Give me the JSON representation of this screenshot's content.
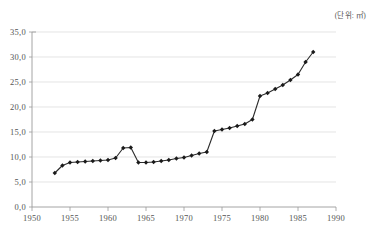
{
  "chart_data": {
    "type": "line",
    "title": "",
    "subtitle": "",
    "unit_label": "(단위: ㎡)",
    "xlabel": "",
    "ylabel": "",
    "xlim": [
      1950,
      1990
    ],
    "ylim": [
      0.0,
      35.0
    ],
    "grid": true,
    "legend": "none",
    "marker": "diamond",
    "line_color": "#2b2b2b",
    "marker_color": "#1a1a1a",
    "grid_color": "#d8d8d8",
    "axis_color": "#9a9a9a",
    "y_ticks": [
      "0,0",
      "5,0",
      "10,0",
      "15,0",
      "20,0",
      "25,0",
      "30,0",
      "35,0"
    ],
    "y_tick_values": [
      0,
      5,
      10,
      15,
      20,
      25,
      30,
      35
    ],
    "x_ticks": [
      "1950",
      "1955",
      "1960",
      "1965",
      "1970",
      "1975",
      "1980",
      "1985",
      "1990"
    ],
    "x_tick_values": [
      1950,
      1955,
      1960,
      1965,
      1970,
      1975,
      1980,
      1985,
      1990
    ],
    "x": [
      1953,
      1954,
      1955,
      1956,
      1957,
      1958,
      1959,
      1960,
      1961,
      1962,
      1963,
      1964,
      1965,
      1966,
      1967,
      1968,
      1969,
      1970,
      1971,
      1972,
      1973,
      1974,
      1975,
      1976,
      1977,
      1978,
      1979,
      1980,
      1981,
      1982,
      1983,
      1984,
      1985,
      1986,
      1987
    ],
    "values": [
      6.8,
      8.3,
      8.9,
      9.0,
      9.1,
      9.2,
      9.3,
      9.4,
      9.8,
      11.8,
      11.9,
      8.9,
      8.9,
      9.0,
      9.2,
      9.4,
      9.7,
      9.9,
      10.3,
      10.7,
      11.0,
      15.2,
      15.5,
      15.8,
      16.2,
      16.6,
      17.5,
      22.2,
      22.8,
      23.6,
      24.4,
      25.4,
      26.5,
      29.0,
      31.0
    ],
    "series": [
      {
        "name": "",
        "values": [
          6.8,
          8.3,
          8.9,
          9.0,
          9.1,
          9.2,
          9.3,
          9.4,
          9.8,
          11.8,
          11.9,
          8.9,
          8.9,
          9.0,
          9.2,
          9.4,
          9.7,
          9.9,
          10.3,
          10.7,
          11.0,
          15.2,
          15.5,
          15.8,
          16.2,
          16.6,
          17.5,
          22.2,
          22.8,
          23.6,
          24.4,
          25.4,
          26.5,
          29.0,
          31.0
        ]
      }
    ]
  }
}
